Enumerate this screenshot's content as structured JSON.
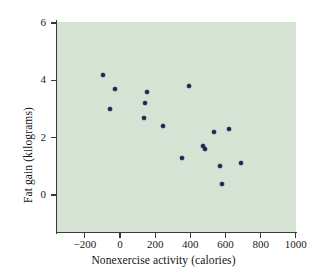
{
  "chart_data": {
    "type": "scatter",
    "title": "",
    "xlabel": "Nonexercise activity (calories)",
    "ylabel": "Fat gain (kilograms)",
    "xlim": [
      -320,
      1030
    ],
    "ylim": [
      -1.3,
      6.5
    ],
    "grid": false,
    "legend": "none",
    "xticks": [
      -200,
      0,
      200,
      400,
      600,
      800,
      1000
    ],
    "xtick_labels": [
      "−200",
      "0",
      "200",
      "400",
      "600",
      "800",
      "1000"
    ],
    "yticks": [
      0,
      2,
      4,
      6
    ],
    "ytick_labels": [
      "0",
      "2",
      "4",
      "6"
    ],
    "marker_color": "#1c2452",
    "panel_color": "#d6e3d4",
    "series": [
      {
        "name": "Subjects",
        "points": [
          {
            "x": -94,
            "y": 4.2
          },
          {
            "x": -57,
            "y": 3.0
          },
          {
            "x": -29,
            "y": 3.7
          },
          {
            "x": 135,
            "y": 2.7
          },
          {
            "x": 143,
            "y": 3.2
          },
          {
            "x": 151,
            "y": 3.6
          },
          {
            "x": 245,
            "y": 2.4
          },
          {
            "x": 355,
            "y": 1.3
          },
          {
            "x": 392,
            "y": 3.8
          },
          {
            "x": 473,
            "y": 1.7
          },
          {
            "x": 486,
            "y": 1.6
          },
          {
            "x": 535,
            "y": 2.2
          },
          {
            "x": 571,
            "y": 1.0
          },
          {
            "x": 580,
            "y": 0.4
          },
          {
            "x": 620,
            "y": 2.3
          },
          {
            "x": 690,
            "y": 1.1
          }
        ]
      }
    ]
  }
}
